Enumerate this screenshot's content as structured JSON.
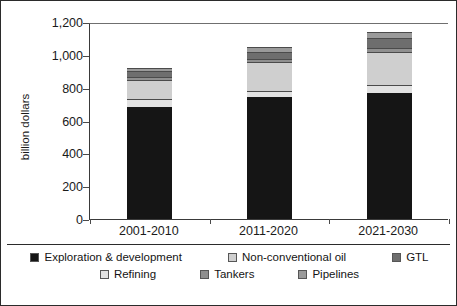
{
  "chart_data": {
    "type": "bar",
    "subtype": "stacked-bar",
    "title": "",
    "xlabel": "",
    "ylabel": "billion dollars",
    "ylim": [
      0,
      1200
    ],
    "ytick_step": 200,
    "ytick_labels": [
      "0",
      "200",
      "400",
      "600",
      "800",
      "1,000",
      "1,200"
    ],
    "ytick_values": [
      0,
      200,
      400,
      600,
      800,
      1000,
      1200
    ],
    "grid": false,
    "legend_position": "bottom",
    "categories": [
      "2001-2010",
      "2011-2020",
      "2021-2030"
    ],
    "series": [
      {
        "name": "Exploration & development",
        "color": "#151515",
        "values": [
          680,
          745,
          770
        ]
      },
      {
        "name": "Refining",
        "color": "#e2e2e2",
        "values": [
          50,
          35,
          45
        ]
      },
      {
        "name": "Non-conventional oil",
        "color": "#cfcfcf",
        "values": [
          115,
          175,
          205
        ]
      },
      {
        "name": "Tankers",
        "color": "#8f8f8f",
        "values": [
          20,
          20,
          20
        ]
      },
      {
        "name": "GTL",
        "color": "#6e6e6e",
        "values": [
          35,
          45,
          65
        ]
      },
      {
        "name": "Pipelines",
        "color": "#9a9a9a",
        "values": [
          20,
          30,
          35
        ]
      }
    ],
    "totals": [
      920,
      1050,
      1140
    ]
  },
  "legend": {
    "row1": [
      {
        "label": "Exploration & development",
        "color": "#151515"
      },
      {
        "label": "Non-conventional oil",
        "color": "#cfcfcf"
      },
      {
        "label": "GTL",
        "color": "#6e6e6e"
      }
    ],
    "row2": [
      {
        "label": "Refining",
        "color": "#e2e2e2"
      },
      {
        "label": "Tankers",
        "color": "#8f8f8f"
      },
      {
        "label": "Pipelines",
        "color": "#9a9a9a"
      }
    ]
  }
}
